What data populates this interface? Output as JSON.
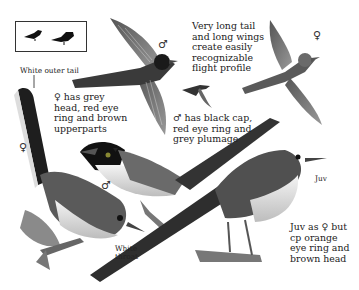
{
  "plate": {
    "subject": "Sardinian Warbler",
    "silhouette_box": {
      "icons": [
        "perched-bird-silhouette-small",
        "perched-bird-silhouette-large"
      ]
    },
    "annotations": {
      "outer_tail": "White outer tail",
      "flight": [
        "Very long tail",
        "and long wings",
        "create easily",
        "recognizable",
        "flight profile"
      ],
      "female": [
        "♀ has grey",
        "head, red eye",
        "ring and brown",
        "upperparts"
      ],
      "male": [
        "♂ has black cap,",
        "red eye ring and",
        "grey plumage"
      ],
      "throat": [
        "White",
        "throat"
      ],
      "juvenile_tag": "Juv",
      "juvenile": [
        "Juv as ♀ but",
        "cp orange",
        "eye ring and",
        "brown head"
      ]
    },
    "sex_symbols": {
      "male_flight": "♂",
      "female_flight": "♀",
      "female_perched": "♀",
      "male_perched": "♂"
    },
    "colors": {
      "ink": "#222222",
      "bird_dark": "#2a2a2a",
      "bird_mid": "#6e6e6e",
      "bird_light": "#bdbdbd",
      "paper": "#ffffff"
    }
  }
}
